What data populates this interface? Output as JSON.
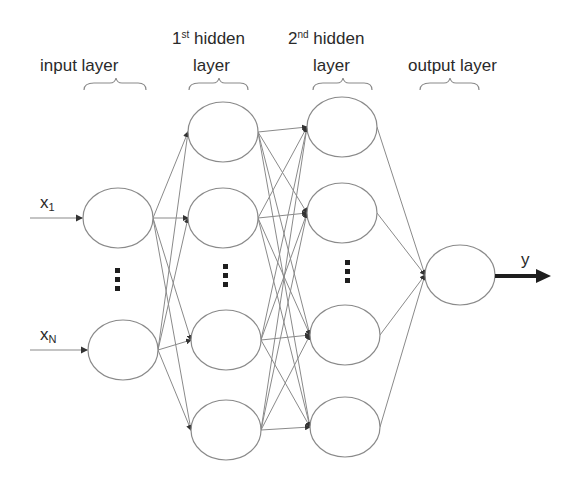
{
  "diagram": {
    "title_labels": {
      "input": "input layer",
      "hidden1_num": "1",
      "hidden1_sup": "st",
      "hidden1_rest": " hidden",
      "hidden1_line2": "layer",
      "hidden2_num": "2",
      "hidden2_sup": "nd",
      "hidden2_rest": " hidden",
      "hidden2_line2": "layer",
      "output": "output layer"
    },
    "inputs": [
      {
        "name": "x",
        "sub": "1"
      },
      {
        "name": "x",
        "sub": "N"
      }
    ],
    "output_var": "y",
    "layers": [
      {
        "id": "input",
        "nodes": [
          [
            118,
            218
          ],
          [
            123,
            350
          ]
        ]
      },
      {
        "id": "hidden1",
        "nodes": [
          [
            223,
            132
          ],
          [
            223,
            218
          ],
          [
            226,
            340
          ],
          [
            226,
            430
          ]
        ]
      },
      {
        "id": "hidden2",
        "nodes": [
          [
            342,
            127
          ],
          [
            342,
            213
          ],
          [
            345,
            335
          ],
          [
            345,
            427
          ]
        ]
      },
      {
        "id": "output",
        "nodes": [
          [
            460,
            275
          ]
        ]
      }
    ],
    "node_rx": 35,
    "node_ry": 30,
    "ellipsis_symbol": "⋮",
    "colors": {
      "stroke": "#8a8a8a",
      "text": "#2a2a2a",
      "arrow": "#1e1e1e"
    }
  }
}
